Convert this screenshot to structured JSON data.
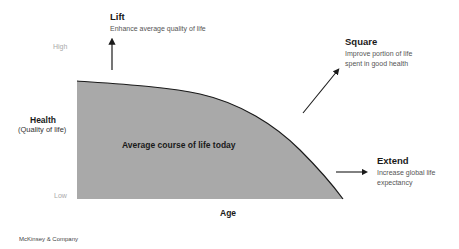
{
  "diagram": {
    "y_axis": {
      "title": "Health",
      "subtitle": "(Quality of life)",
      "high_label": "High",
      "low_label": "Low"
    },
    "x_axis": {
      "title": "Age"
    },
    "area": {
      "label": "Average course of life today",
      "fill_color": "#a9a9a9",
      "line_color": "#1a1a1a"
    },
    "annotations": {
      "lift": {
        "title": "Lift",
        "description": "Enhance average quality of life",
        "arrow_direction": "up"
      },
      "square": {
        "title": "Square",
        "description_lines": [
          "Improve portion of life",
          "spent in good health"
        ],
        "arrow_direction": "up-right"
      },
      "extend": {
        "title": "Extend",
        "description_lines": [
          "Increase global life",
          "expectancy"
        ],
        "arrow_direction": "right"
      }
    },
    "source": "McKinsey & Company"
  }
}
